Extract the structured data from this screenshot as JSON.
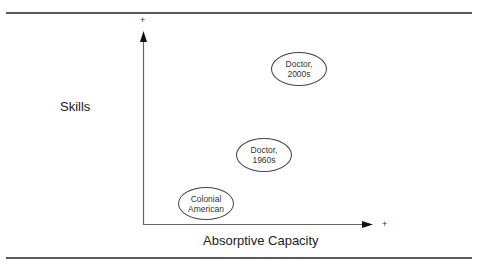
{
  "diagram": {
    "y_axis": {
      "label": "Skills",
      "end_marker": "+"
    },
    "x_axis": {
      "label": "Absorptive Capacity",
      "end_marker": "+"
    },
    "nodes": [
      {
        "id": "doctor-2000s",
        "line1": "Doctor,",
        "line2": "2000s"
      },
      {
        "id": "doctor-1960s",
        "line1": "Doctor,",
        "line2": "1960s"
      },
      {
        "id": "colonial-american",
        "line1": "Colonial",
        "line2": "American"
      }
    ]
  }
}
